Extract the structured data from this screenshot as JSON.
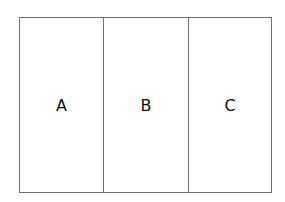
{
  "diagram": {
    "panels": [
      {
        "label": "A"
      },
      {
        "label": "B"
      },
      {
        "label": "C"
      }
    ],
    "colors": {
      "border": "#6e6e6e",
      "text": "#111111",
      "background": "#ffffff"
    }
  }
}
